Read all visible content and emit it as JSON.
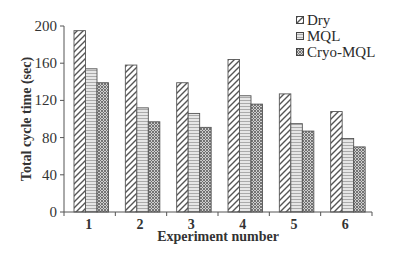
{
  "chart_data": {
    "type": "bar",
    "title": "",
    "xlabel": "Experiment number",
    "ylabel": "Total cycle time (sec)",
    "categories": [
      "1",
      "2",
      "3",
      "4",
      "5",
      "6"
    ],
    "series": [
      {
        "name": "Dry",
        "pattern": "wide-diagonal-hatch",
        "values": [
          195,
          158,
          139,
          164,
          127,
          108
        ]
      },
      {
        "name": "MQL",
        "pattern": "fine-wave-hatch",
        "values": [
          154,
          112,
          106,
          125,
          95,
          79
        ]
      },
      {
        "name": "Cryo-MQL",
        "pattern": "dense-crosshatch",
        "values": [
          139,
          97,
          91,
          116,
          87,
          70
        ]
      }
    ],
    "ylim": [
      0,
      200
    ],
    "yticks": [
      0,
      40,
      80,
      120,
      160,
      200
    ],
    "grid": false,
    "legend_position": "top-right"
  },
  "legend": {
    "items": [
      {
        "label": "Dry"
      },
      {
        "label": "MQL"
      },
      {
        "label": "Cryo-MQL"
      }
    ]
  },
  "axes": {
    "xlabel": "Experiment number",
    "ylabel": "Total cycle time (sec)"
  }
}
